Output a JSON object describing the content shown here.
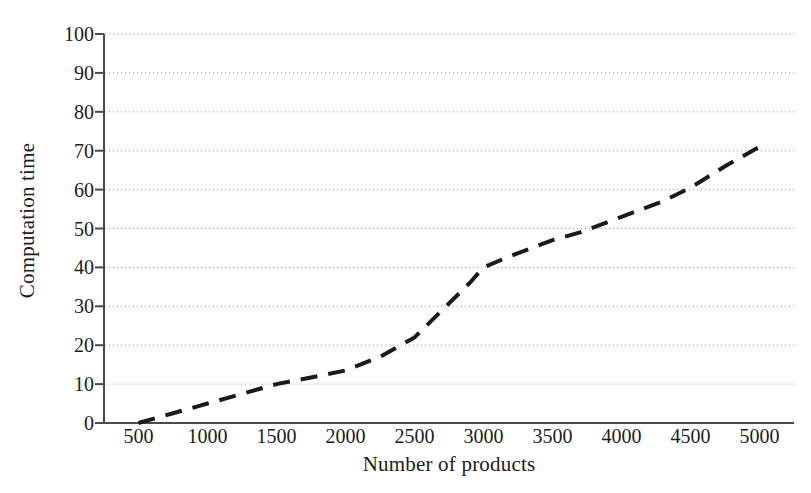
{
  "chart_data": {
    "type": "line",
    "title": "",
    "xlabel": "Number of products",
    "ylabel": "Computation time",
    "xlim": [
      250,
      5250
    ],
    "ylim": [
      0,
      100
    ],
    "xticks": [
      500,
      1000,
      1500,
      2000,
      2500,
      3000,
      3500,
      4000,
      4500,
      5000
    ],
    "xtick_labels": [
      "500",
      "1000",
      "1500",
      "2000",
      "2500",
      "3000",
      "3500",
      "4000",
      "4500",
      "5000"
    ],
    "yticks": [
      0,
      10,
      20,
      30,
      40,
      50,
      60,
      70,
      80,
      90,
      100
    ],
    "ytick_labels": [
      "0",
      "10",
      "20",
      "30",
      "40",
      "50",
      "60",
      "70",
      "80",
      "90",
      "100"
    ],
    "grid": "horizontal-dotted",
    "legend": "none",
    "series": [
      {
        "name": "Computation time",
        "style": "dashed",
        "color": "#1a1a1a",
        "x": [
          500,
          750,
          1000,
          1250,
          1500,
          1750,
          2000,
          2250,
          2500,
          2700,
          2900,
          3000,
          3200,
          3500,
          3700,
          4000,
          4300,
          4500,
          4750,
          5000
        ],
        "y": [
          0,
          2.5,
          5,
          7.5,
          10,
          11.7,
          13.5,
          17,
          22,
          29,
          36,
          40,
          43,
          47,
          49,
          53,
          57,
          60.5,
          66,
          71
        ]
      }
    ]
  },
  "axes": {
    "y_axis_name": "Computation time",
    "x_axis_name": "Number of products"
  }
}
